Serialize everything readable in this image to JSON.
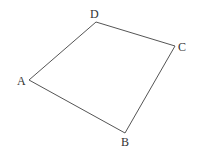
{
  "diagram": {
    "type": "quadrilateral",
    "vertices": [
      {
        "name": "A",
        "x": 29,
        "y": 80,
        "label_x": 17,
        "label_y": 85
      },
      {
        "name": "B",
        "x": 125,
        "y": 133,
        "label_x": 121,
        "label_y": 146
      },
      {
        "name": "C",
        "x": 175,
        "y": 46,
        "label_x": 178,
        "label_y": 51
      },
      {
        "name": "D",
        "x": 96,
        "y": 22,
        "label_x": 90,
        "label_y": 18
      }
    ],
    "edges": [
      [
        "A",
        "B"
      ],
      [
        "B",
        "C"
      ],
      [
        "C",
        "D"
      ],
      [
        "D",
        "A"
      ]
    ],
    "stroke_color": "#555555",
    "label_color": "#333333"
  },
  "labels": {
    "A": "A",
    "B": "B",
    "C": "C",
    "D": "D"
  }
}
